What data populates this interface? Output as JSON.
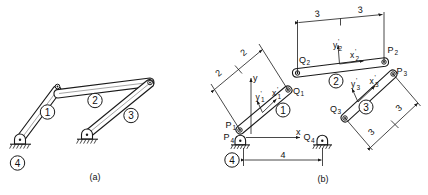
{
  "figure": {
    "title_a": "(a)",
    "title_b": "(b)"
  },
  "panel_a": {
    "caption": "(a)",
    "links": [
      {
        "id": "link-1",
        "label": "1"
      },
      {
        "id": "link-2",
        "label": "2"
      },
      {
        "id": "link-3",
        "label": "3"
      },
      {
        "id": "link-4",
        "label": "4"
      }
    ]
  },
  "panel_b": {
    "caption": "(b)",
    "links": [
      {
        "id": "link-1",
        "label": "1",
        "start": "P1",
        "end": "Q1"
      },
      {
        "id": "link-2",
        "label": "2",
        "start": "Q2",
        "end": "P2"
      },
      {
        "id": "link-3",
        "label": "3",
        "start": "Q3",
        "end": "P3"
      },
      {
        "id": "link-4",
        "label": "4",
        "start": "P4",
        "end": "Q4"
      }
    ],
    "points": [
      {
        "name": "P1",
        "base": "P",
        "sub": "1"
      },
      {
        "name": "Q1",
        "base": "Q",
        "sub": "1"
      },
      {
        "name": "P2",
        "base": "P",
        "sub": "2"
      },
      {
        "name": "Q2",
        "base": "Q",
        "sub": "2"
      },
      {
        "name": "P3",
        "base": "P",
        "sub": "3"
      },
      {
        "name": "Q3",
        "base": "Q",
        "sub": "3"
      },
      {
        "name": "P4",
        "base": "P",
        "sub": "4"
      },
      {
        "name": "Q4",
        "base": "Q",
        "sub": "4"
      }
    ],
    "global_axes": {
      "x_label": "x",
      "y_label": "y"
    },
    "local_frames": [
      {
        "link": "1",
        "x_base": "x",
        "x_sub": "1",
        "y_base": "y",
        "y_sub": "1",
        "prime": "'"
      },
      {
        "link": "2",
        "x_base": "x",
        "x_sub": "2",
        "y_base": "y",
        "y_sub": "2",
        "prime": "'"
      },
      {
        "link": "3",
        "x_base": "x",
        "x_sub": "3",
        "y_base": "y",
        "y_sub": "3",
        "prime": "'"
      }
    ],
    "dimensions": [
      {
        "id": "dim-link1-a",
        "value": "2",
        "link": "1"
      },
      {
        "id": "dim-link1-b",
        "value": "2",
        "link": "1"
      },
      {
        "id": "dim-link2-a",
        "value": "3",
        "link": "2"
      },
      {
        "id": "dim-link2-b",
        "value": "3",
        "link": "2"
      },
      {
        "id": "dim-link3-a",
        "value": "3",
        "link": "3"
      },
      {
        "id": "dim-link3-b",
        "value": "3",
        "link": "3"
      },
      {
        "id": "dim-link4",
        "value": "4",
        "link": "4"
      }
    ]
  }
}
